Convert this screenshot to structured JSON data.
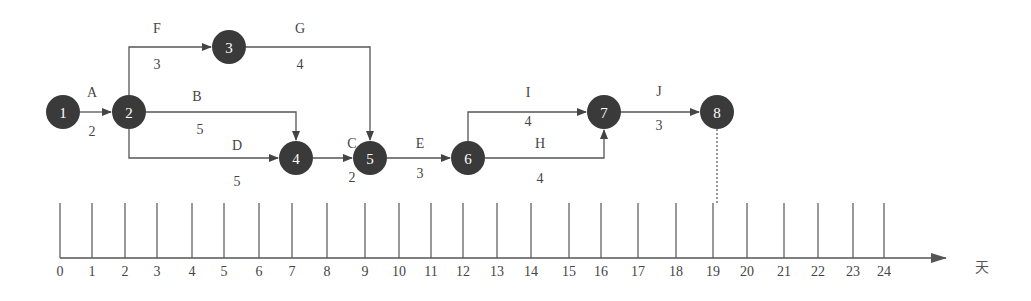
{
  "diagram": {
    "type": "activity-on-arrow network with time scale",
    "nodes": [
      {
        "id": "1",
        "label": "1",
        "x": 63,
        "y": 112
      },
      {
        "id": "2",
        "label": "2",
        "x": 129,
        "y": 112
      },
      {
        "id": "3",
        "label": "3",
        "x": 229,
        "y": 47
      },
      {
        "id": "4",
        "label": "4",
        "x": 296,
        "y": 158
      },
      {
        "id": "5",
        "label": "5",
        "x": 370,
        "y": 158
      },
      {
        "id": "6",
        "label": "6",
        "x": 468,
        "y": 158
      },
      {
        "id": "7",
        "label": "7",
        "x": 604,
        "y": 112
      },
      {
        "id": "8",
        "label": "8",
        "x": 717,
        "y": 112
      }
    ],
    "activities": [
      {
        "name": "A",
        "duration": "2",
        "from": "1",
        "to": "2"
      },
      {
        "name": "F",
        "duration": "3",
        "from": "2",
        "to": "3"
      },
      {
        "name": "G",
        "duration": "4",
        "from": "3",
        "to": "5"
      },
      {
        "name": "B",
        "duration": "5",
        "from": "2",
        "to": "4"
      },
      {
        "name": "D",
        "duration": "5",
        "from": "2",
        "to": "4"
      },
      {
        "name": "C",
        "duration": "2",
        "from": "4",
        "to": "5"
      },
      {
        "name": "E",
        "duration": "3",
        "from": "5",
        "to": "6"
      },
      {
        "name": "I",
        "duration": "4",
        "from": "6",
        "to": "7"
      },
      {
        "name": "H",
        "duration": "4",
        "from": "6",
        "to": "7"
      },
      {
        "name": "J",
        "duration": "3",
        "from": "7",
        "to": "8"
      }
    ],
    "timeline": {
      "ticks": [
        "0",
        "1",
        "2",
        "3",
        "4",
        "5",
        "6",
        "7",
        "8",
        "9",
        "10",
        "11",
        "12",
        "13",
        "14",
        "15",
        "16",
        "17",
        "18",
        "19",
        "20",
        "21",
        "22",
        "23",
        "24"
      ],
      "tick_x": [
        60,
        92,
        125,
        157,
        192,
        224,
        259,
        292,
        327,
        365,
        399,
        431,
        463,
        497,
        531,
        569,
        601,
        638,
        676,
        713,
        747,
        784,
        818,
        853,
        884
      ],
      "unit": "天",
      "end_marker": {
        "node": "8",
        "tick": "19"
      }
    }
  },
  "labels": {
    "A": "A",
    "A_dur": "2",
    "F": "F",
    "F_dur": "3",
    "G": "G",
    "G_dur": "4",
    "B": "B",
    "B_dur": "5",
    "D": "D",
    "D_dur": "5",
    "C": "C",
    "C_dur": "2",
    "E": "E",
    "E_dur": "3",
    "I": "I",
    "I_dur": "4",
    "H": "H",
    "H_dur": "4",
    "J": "J",
    "J_dur": "3"
  },
  "colors": {
    "node_fill": "#3a3a3a",
    "line": "#555555",
    "text": "#444444"
  }
}
